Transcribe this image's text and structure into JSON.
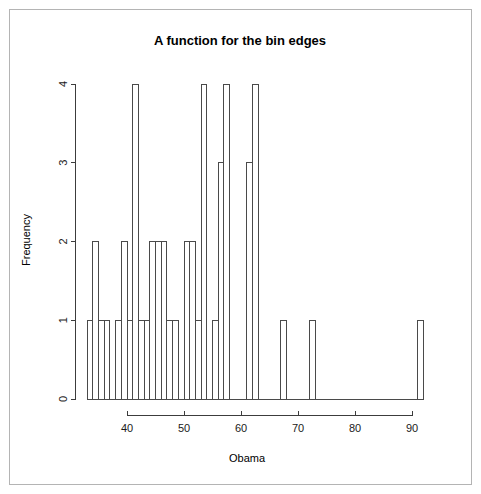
{
  "chart_data": {
    "type": "bar",
    "title": "A function for the bin edges",
    "xlabel": "Obama",
    "ylabel": "Frequency",
    "xlim": [
      32,
      93
    ],
    "ylim": [
      0,
      4
    ],
    "xticks": [
      "40",
      "50",
      "60",
      "70",
      "80",
      "90"
    ],
    "xtick_values": [
      40,
      50,
      60,
      70,
      80,
      90
    ],
    "yticks": [
      "0",
      "1",
      "2",
      "3",
      "4"
    ],
    "ytick_values": [
      0,
      1,
      2,
      3,
      4
    ],
    "grid": false,
    "legend": null,
    "bin_width": 1,
    "bin_starts": [
      33,
      34,
      35,
      36,
      37,
      38,
      39,
      40,
      41,
      42,
      43,
      44,
      45,
      46,
      47,
      48,
      49,
      50,
      51,
      52,
      53,
      54,
      55,
      56,
      57,
      58,
      59,
      60,
      61,
      62,
      67,
      72,
      91
    ],
    "values": [
      1,
      2,
      1,
      1,
      2,
      1,
      1,
      4,
      1,
      1,
      2,
      2,
      2,
      1,
      1,
      2,
      2,
      1,
      4,
      1,
      3,
      4,
      1,
      1,
      3,
      4,
      1,
      1,
      1,
      1,
      1,
      1,
      1
    ],
    "bars": [
      {
        "start": 33,
        "end": 34,
        "count": 1
      },
      {
        "start": 34,
        "end": 35,
        "count": 2
      },
      {
        "start": 35,
        "end": 36,
        "count": 1
      },
      {
        "start": 36,
        "end": 37,
        "count": 1
      },
      {
        "start": 38,
        "end": 39,
        "count": 1
      },
      {
        "start": 39,
        "end": 40,
        "count": 2
      },
      {
        "start": 40,
        "end": 41,
        "count": 1
      },
      {
        "start": 41,
        "end": 42,
        "count": 4
      },
      {
        "start": 42,
        "end": 43,
        "count": 1
      },
      {
        "start": 43,
        "end": 44,
        "count": 1
      },
      {
        "start": 44,
        "end": 45,
        "count": 2
      },
      {
        "start": 45,
        "end": 46,
        "count": 2
      },
      {
        "start": 46,
        "end": 47,
        "count": 2
      },
      {
        "start": 47,
        "end": 48,
        "count": 1
      },
      {
        "start": 48,
        "end": 49,
        "count": 1
      },
      {
        "start": 50,
        "end": 51,
        "count": 2
      },
      {
        "start": 51,
        "end": 52,
        "count": 2
      },
      {
        "start": 52,
        "end": 53,
        "count": 1
      },
      {
        "start": 53,
        "end": 54,
        "count": 4
      },
      {
        "start": 55,
        "end": 56,
        "count": 1
      },
      {
        "start": 56,
        "end": 57,
        "count": 3
      },
      {
        "start": 57,
        "end": 58,
        "count": 4
      },
      {
        "start": 61,
        "end": 62,
        "count": 3
      },
      {
        "start": 62,
        "end": 63,
        "count": 4
      },
      {
        "start": 67,
        "end": 68,
        "count": 1
      },
      {
        "start": 72,
        "end": 73,
        "count": 1
      },
      {
        "start": 91,
        "end": 92,
        "count": 1
      }
    ],
    "colors": {
      "bar_stroke": "#4a4a4a",
      "bar_fill": "none",
      "axis": "#3c3c3c",
      "text": "#000000",
      "frame": "#b4b4b4",
      "background": "#ffffff"
    }
  }
}
